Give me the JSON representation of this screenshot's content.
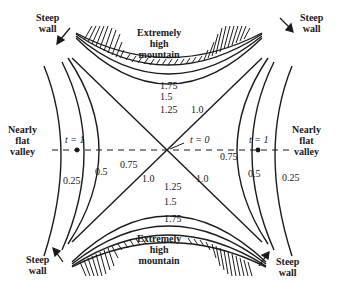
{
  "diagram": {
    "regions": {
      "top_mountain": [
        "Extremely",
        "high",
        "mountain"
      ],
      "bottom_mountain": [
        "Extremely",
        "high",
        "mountain"
      ],
      "left_valley": [
        "Nearly",
        "flat",
        "valley"
      ],
      "right_valley": [
        "Nearly",
        "flat",
        "valley"
      ]
    },
    "walls": {
      "top_left": [
        "Steep",
        "wall"
      ],
      "top_right": [
        "Steep",
        "wall"
      ],
      "bottom_left": [
        "Steep",
        "wall"
      ],
      "bottom_right": [
        "Steep",
        "wall"
      ]
    },
    "time_markers": {
      "center": "t = 0",
      "left": "t = 1",
      "right": "t = 1"
    },
    "contour_labels": {
      "left": [
        "0.25",
        "0.5",
        "0.75"
      ],
      "right": [
        "0.75",
        "0.5",
        "0.25"
      ],
      "top": [
        "1.75",
        "1.5",
        "1.25",
        "1.0"
      ],
      "bottom": [
        "1.0",
        "1.25",
        "1.5",
        "1.75",
        "1.0"
      ],
      "center_left": "1.0",
      "center_right": "1.0"
    },
    "colors": {
      "ink": "#1a1a1a",
      "background": "#ffffff"
    }
  }
}
